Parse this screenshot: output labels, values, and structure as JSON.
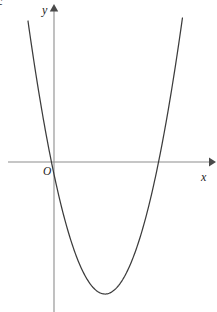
{
  "figure": {
    "caption_fragment": "c",
    "background_color": "#ffffff",
    "curve_color": "#3c3c3c",
    "axis_color": "#8d8d8d",
    "label_color": "#1c1c1c",
    "width": 217,
    "height": 312
  },
  "labels": {
    "x_axis": "x",
    "y_axis": "y",
    "origin": "O"
  },
  "chart_data": {
    "type": "line",
    "title": "",
    "subtitle": "",
    "xlabel": "x",
    "ylabel": "y",
    "grid": false,
    "legend": false,
    "legend_position": "none",
    "origin_label": "O",
    "axes": {
      "x_axis_pixel_y": 162,
      "y_axis_pixel_x": 54,
      "x_axis_span_px": [
        8,
        215
      ],
      "y_axis_span_px": [
        5,
        312
      ],
      "x_arrow": "right",
      "y_arrow": "up",
      "ticks_x": [],
      "ticks_y": [],
      "xlim": [
        -1.0,
        4.1
      ],
      "ylim": [
        -3.4,
        4.0
      ]
    },
    "series": [
      {
        "name": "parabola",
        "shape": "upward parabola",
        "equation": "y = a(x - h)^2 + k",
        "vertex": [
          1.0,
          -2.6
        ],
        "vertex_pixel": [
          105,
          294
        ],
        "x_intercepts": [
          0.0,
          2.05
        ],
        "x_intercepts_pixel": [
          55,
          158
        ],
        "y_intercept": 0.0,
        "opens": "up",
        "endpoints_pixel": [
          [
            32,
            21
          ],
          [
            180,
            18
          ]
        ],
        "x": [
          -0.45,
          -0.3,
          -0.15,
          0.0,
          0.25,
          0.5,
          0.75,
          1.0,
          1.25,
          1.5,
          1.75,
          2.05,
          2.3,
          2.55,
          2.8,
          3.05
        ],
        "values": [
          3.05,
          2.2,
          1.05,
          0.0,
          -1.05,
          -1.85,
          -2.4,
          -2.6,
          -2.45,
          -2.0,
          -1.25,
          0.0,
          0.9,
          1.95,
          3.0,
          3.45
        ]
      }
    ]
  }
}
